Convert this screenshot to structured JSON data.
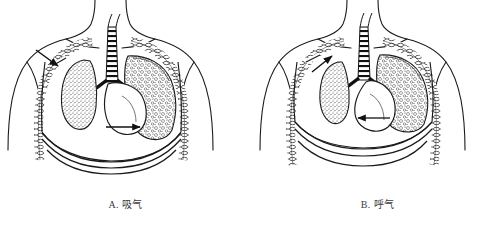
{
  "figure": {
    "background_color": "#ffffff",
    "ink_color": "#1a1a1a",
    "width": 503,
    "height": 225
  },
  "panels": [
    {
      "id": "panel-a",
      "caption": "A. 吸气",
      "letter": "A",
      "phase_label": "吸气",
      "wound_side": "left-chest-wall",
      "wound_arrow_direction": "inward",
      "mediastinum_arrow_direction": "right",
      "affected_lung": "collapsed-small",
      "intact_lung": "expanded-stippled",
      "diaphragm": "descended"
    },
    {
      "id": "panel-b",
      "caption": "B. 呼气",
      "letter": "B",
      "phase_label": "呼气",
      "wound_side": "left-chest-wall",
      "wound_arrow_direction": "outward",
      "mediastinum_arrow_direction": "left",
      "affected_lung": "collapsed-smaller",
      "intact_lung": "expanded-stippled",
      "diaphragm": "elevated"
    }
  ],
  "anatomy_labels": {
    "trachea": "trachea",
    "bronchus": "bronchus",
    "lung": "lung",
    "rib": "rib",
    "diaphragm": "diaphragm",
    "mediastinum": "mediastinum",
    "chest_wound": "chest-wound",
    "torso": "torso-outline"
  }
}
